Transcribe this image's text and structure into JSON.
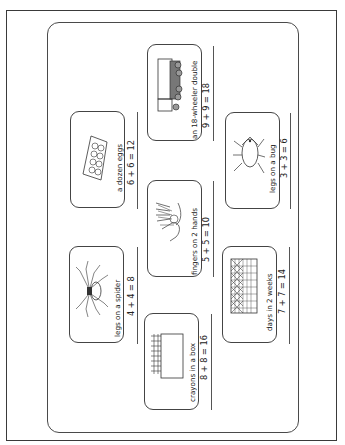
{
  "worksheet": {
    "items": [
      {
        "id": "truck",
        "caption": "an 18-wheeler double",
        "equation": "9 + 9 = 18",
        "icon": "truck-icon"
      },
      {
        "id": "eggs",
        "caption": "a dozen eggs",
        "equation": "6 + 6 = 12",
        "icon": "egg-carton-icon"
      },
      {
        "id": "bug",
        "caption": "legs on a bug",
        "equation": "3 + 3 = 6",
        "icon": "bug-icon"
      },
      {
        "id": "hands",
        "caption": "fingers on 2 hands",
        "equation": "5 + 5 = 10",
        "icon": "hands-icon"
      },
      {
        "id": "spider",
        "caption": "legs on a spider",
        "equation": "4 + 4 = 8",
        "icon": "spider-icon"
      },
      {
        "id": "days",
        "caption": "days in 2 weeks",
        "equation": "7 + 7 = 14",
        "icon": "calendar-icon"
      },
      {
        "id": "crayons",
        "caption": "crayons in a box",
        "equation": "8 + 8 = 16",
        "icon": "crayon-box-icon"
      }
    ]
  },
  "colors": {
    "ink": "#222222",
    "border": "#444444",
    "paper": "#ffffff"
  }
}
